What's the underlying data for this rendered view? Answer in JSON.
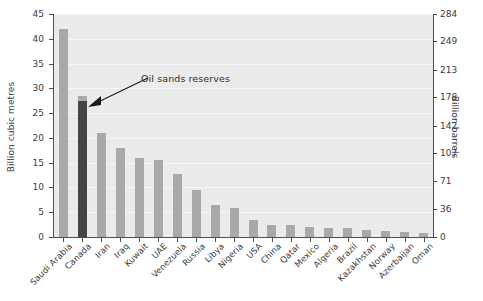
{
  "chart_data": {
    "type": "bar",
    "title": "",
    "xlabel": "",
    "ylabel": "Billion cubic metres",
    "ylabel_right": "Billion barrels",
    "ylim": [
      0,
      45
    ],
    "ylim_right": [
      0,
      284
    ],
    "grid": true,
    "legend": "none",
    "categories": [
      "Saudi Arabia",
      "Canada",
      "Iran",
      "Iraq",
      "Kuwait",
      "UAE",
      "Venezuela",
      "Russia",
      "Libya",
      "Nigeria",
      "USA",
      "China",
      "Qatar",
      "Mexico",
      "Algeria",
      "Brazil",
      "Kazakhstan",
      "Norway",
      "Azerbaijan",
      "Oman"
    ],
    "values": [
      42,
      28.5,
      21,
      18,
      16,
      15.5,
      12.8,
      9.5,
      6.5,
      5.8,
      3.5,
      2.5,
      2.4,
      2.0,
      1.9,
      1.9,
      1.5,
      1.3,
      1.1,
      0.9
    ],
    "series": [
      {
        "name": "Proven oil reserves",
        "values": [
          42,
          28.5,
          21,
          18,
          16,
          15.5,
          12.8,
          9.5,
          6.5,
          5.8,
          3.5,
          2.5,
          2.4,
          2.0,
          1.9,
          1.9,
          1.5,
          1.3,
          1.1,
          0.9
        ]
      },
      {
        "name": "Oil sands reserves",
        "values": [
          0,
          27.5,
          0,
          0,
          0,
          0,
          0,
          0,
          0,
          0,
          0,
          0,
          0,
          0,
          0,
          0,
          0,
          0,
          0,
          0
        ]
      }
    ],
    "yticks": [
      "0",
      "5",
      "10",
      "15",
      "20",
      "25",
      "30",
      "35",
      "40",
      "45"
    ],
    "ytick_values": [
      0,
      5,
      10,
      15,
      20,
      25,
      30,
      35,
      40,
      45
    ],
    "yticks_right": [
      "0",
      "36",
      "71",
      "107",
      "142",
      "178",
      "213",
      "249",
      "284"
    ],
    "ytick_values_right": [
      0,
      36,
      71,
      107,
      142,
      178,
      213,
      249,
      284
    ],
    "annotations": [
      {
        "text": "Oil sands reserves",
        "target_category": "Canada"
      }
    ],
    "colors": {
      "bar": "#a9a9a9",
      "bar_highlight": "#454545",
      "plot_background": "#ebebeb",
      "gridline": "#f7f7f7",
      "axis": "#4d4d4d",
      "text": "#3b3b3b"
    }
  }
}
